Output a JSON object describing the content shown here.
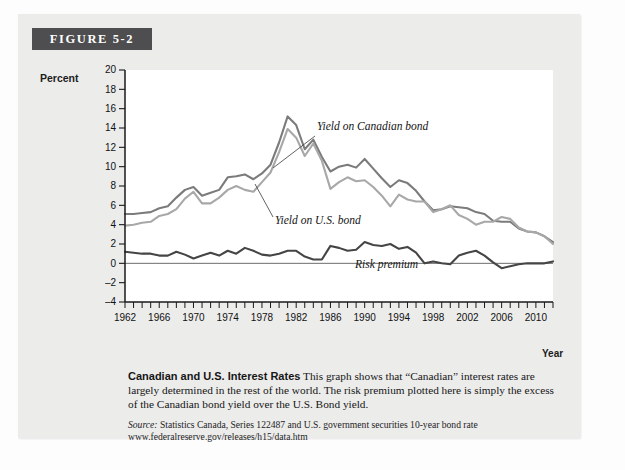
{
  "figure": {
    "banner_label": "FIGURE 5-2",
    "caption_title": "Canadian and U.S. Interest Rates",
    "caption_body": "This graph shows that “Canadian” interest rates are largely determined in the rest of the world. The risk premium plotted here is simply the excess of the Canadian bond yield over the U.S. Bond yield.",
    "source_label": "Source:",
    "source_text": "Statistics Canada, Series 122487 and U.S. government securities 10-year bond rate www.federalreserve.gov/releases/h15/data.htm"
  },
  "colors": {
    "banner_bg": "#4e4e50",
    "panel_bg": "#ececeb",
    "canadian_bond": "#7b7b7b",
    "us_bond": "#a8a8a8",
    "risk_premium": "#454545",
    "axis": "#1a1a1a",
    "zero_line": "#6d6d6d"
  },
  "chart_data": {
    "type": "line",
    "title": "Canadian and U.S. Interest Rates",
    "xlabel": "Year",
    "ylabel": "Percent",
    "xlim": [
      1962,
      2012
    ],
    "ylim": [
      -4,
      20
    ],
    "ytick_step": 2,
    "yticks": [
      -4,
      -2,
      0,
      2,
      4,
      6,
      8,
      10,
      12,
      14,
      16,
      18,
      20
    ],
    "xticks_labeled": [
      1962,
      1966,
      1970,
      1974,
      1978,
      1982,
      1986,
      1990,
      1994,
      1998,
      2002,
      2006,
      2010
    ],
    "xtick_minor_step": 1,
    "grid": false,
    "legend_position": "inline-annotations",
    "annotations": [
      {
        "text": "Yield on Canadian bond",
        "series": "Yield on Canadian bond",
        "points_to_year": 1983
      },
      {
        "text": "Yield on U.S. bond",
        "series": "Yield on U.S. bond",
        "points_to_year": 1983
      },
      {
        "text": "Risk premium",
        "series": "Risk premium",
        "points_to_year": 1993
      }
    ],
    "x": [
      1962,
      1963,
      1964,
      1965,
      1966,
      1967,
      1968,
      1969,
      1970,
      1971,
      1972,
      1973,
      1974,
      1975,
      1976,
      1977,
      1978,
      1979,
      1980,
      1981,
      1982,
      1983,
      1984,
      1985,
      1986,
      1987,
      1988,
      1989,
      1990,
      1991,
      1992,
      1993,
      1994,
      1995,
      1996,
      1997,
      1998,
      1999,
      2000,
      2001,
      2002,
      2003,
      2004,
      2005,
      2006,
      2007,
      2008,
      2009,
      2010,
      2011,
      2012
    ],
    "series": [
      {
        "name": "Yield on Canadian bond",
        "color": "#7b7b7b",
        "values": [
          5.1,
          5.1,
          5.2,
          5.3,
          5.7,
          5.9,
          6.8,
          7.6,
          7.9,
          7.0,
          7.3,
          7.6,
          8.9,
          9.0,
          9.2,
          8.7,
          9.3,
          10.2,
          12.5,
          15.2,
          14.3,
          11.8,
          12.8,
          11.0,
          9.5,
          10.0,
          10.2,
          9.9,
          10.8,
          9.8,
          8.8,
          7.9,
          8.6,
          8.3,
          7.5,
          6.4,
          5.5,
          5.6,
          5.9,
          5.8,
          5.7,
          5.3,
          5.1,
          4.4,
          4.3,
          4.3,
          3.6,
          3.3,
          3.2,
          2.8,
          2.2
        ]
      },
      {
        "name": "Yield on U.S. bond",
        "color": "#a8a8a8",
        "values": [
          3.9,
          4.0,
          4.2,
          4.3,
          4.9,
          5.1,
          5.6,
          6.7,
          7.4,
          6.2,
          6.2,
          6.8,
          7.6,
          8.0,
          7.6,
          7.4,
          8.4,
          9.4,
          11.5,
          13.9,
          13.0,
          11.1,
          12.4,
          10.6,
          7.7,
          8.4,
          8.9,
          8.5,
          8.6,
          7.9,
          7.0,
          5.9,
          7.1,
          6.6,
          6.4,
          6.4,
          5.3,
          5.6,
          6.0,
          5.0,
          4.6,
          4.0,
          4.3,
          4.3,
          4.8,
          4.6,
          3.7,
          3.3,
          3.2,
          2.8,
          2.0
        ]
      },
      {
        "name": "Risk premium",
        "color": "#454545",
        "values": [
          1.2,
          1.1,
          1.0,
          1.0,
          0.8,
          0.8,
          1.2,
          0.9,
          0.5,
          0.8,
          1.1,
          0.8,
          1.3,
          1.0,
          1.6,
          1.3,
          0.9,
          0.8,
          1.0,
          1.3,
          1.3,
          0.7,
          0.4,
          0.4,
          1.8,
          1.6,
          1.3,
          1.4,
          2.2,
          1.9,
          1.8,
          2.0,
          1.5,
          1.7,
          1.1,
          0.0,
          0.2,
          0.0,
          -0.1,
          0.8,
          1.1,
          1.3,
          0.8,
          0.1,
          -0.5,
          -0.3,
          -0.1,
          0.0,
          0.0,
          0.0,
          0.2
        ]
      }
    ],
    "note": "Risk premium is the gap between the Canadian and U.S. bond yields; it dips to about -2.7 in 1974 and peaks near 4 in 1990 on the plotted curve."
  }
}
